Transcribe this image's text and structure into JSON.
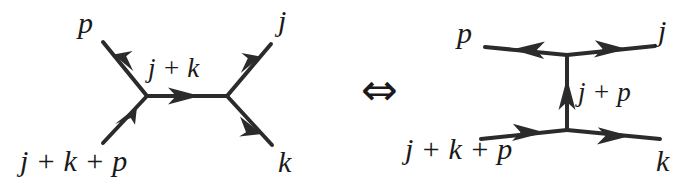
{
  "figure": {
    "type": "feynman-diagram-equivalence",
    "background_color": "#ffffff",
    "ink_color": "#2b2b2b",
    "relation_symbol": "⇔",
    "relation_name": "if-and-only-if-arrow"
  },
  "left_diagram": {
    "name": "s-channel-diagram",
    "external_labels": {
      "top_left": "p",
      "top_right": "j",
      "bottom_left": "j + k + p",
      "bottom_right": "k"
    },
    "internal_label": "j + k",
    "vertices": [
      {
        "id": "v1",
        "x": 147,
        "y": 96
      },
      {
        "id": "v2",
        "x": 227,
        "y": 96
      }
    ],
    "edges": [
      {
        "id": "leg-p",
        "from": "v1",
        "to": {
          "x": 103,
          "y": 42
        },
        "arrow": "outgoing",
        "label": "p"
      },
      {
        "id": "leg-jkp",
        "from": {
          "x": 103,
          "y": 143
        },
        "to": "v1",
        "arrow": "incoming",
        "label": "j + k + p"
      },
      {
        "id": "propagator-jk",
        "from": "v1",
        "to": "v2",
        "arrow": "rightward",
        "label": "j + k"
      },
      {
        "id": "leg-j",
        "from": "v2",
        "to": {
          "x": 271,
          "y": 44
        },
        "arrow": "outgoing",
        "label": "j"
      },
      {
        "id": "leg-k",
        "from": "v2",
        "to": {
          "x": 272,
          "y": 145
        },
        "arrow": "outgoing",
        "label": "k"
      }
    ]
  },
  "right_diagram": {
    "name": "t-channel-diagram",
    "external_labels": {
      "top_left": "p",
      "top_right": "j",
      "bottom_left": "j + k + p",
      "bottom_right": "k"
    },
    "internal_label": "j + p",
    "vertices": [
      {
        "id": "v1",
        "x": 567,
        "y": 55
      },
      {
        "id": "v2",
        "x": 567,
        "y": 130
      }
    ],
    "edges": [
      {
        "id": "leg-p",
        "from": "v1",
        "to": {
          "x": 485,
          "y": 47
        },
        "arrow": "leftward",
        "label": "p"
      },
      {
        "id": "leg-j",
        "from": "v1",
        "to": {
          "x": 655,
          "y": 46
        },
        "arrow": "rightward",
        "label": "j"
      },
      {
        "id": "propagator-jp",
        "from": "v2",
        "to": "v1",
        "arrow": "upward",
        "label": "j + p"
      },
      {
        "id": "leg-jkp",
        "from": {
          "x": 481,
          "y": 139
        },
        "to": "v2",
        "arrow": "rightward",
        "label": "j + k + p"
      },
      {
        "id": "leg-k",
        "from": "v2",
        "to": {
          "x": 660,
          "y": 139
        },
        "arrow": "rightward",
        "label": "k"
      }
    ]
  }
}
